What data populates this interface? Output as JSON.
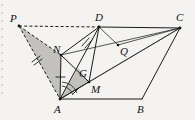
{
  "figure": {
    "background_color": "#f4f3f1",
    "line_color": "#1a1a1a",
    "shade_color": "#b9b7b4",
    "width": 195,
    "height": 120
  },
  "vertices": [
    {
      "id": "P",
      "label": "P",
      "x": 19,
      "y": 26,
      "label_x": 10,
      "label_y": 22
    },
    {
      "id": "D",
      "label": "D",
      "x": 99,
      "y": 27,
      "label_x": 95,
      "label_y": 21
    },
    {
      "id": "C",
      "label": "C",
      "x": 180,
      "y": 28,
      "label_x": 176,
      "label_y": 21
    },
    {
      "id": "N",
      "label": "N",
      "x": 61,
      "y": 55,
      "label_x": 54,
      "label_y": 52
    },
    {
      "id": "Q",
      "label": "Q",
      "x": 118,
      "y": 45,
      "label_x": 120,
      "label_y": 54
    },
    {
      "id": "G",
      "label": "G",
      "x": 78,
      "y": 68,
      "label_x": 80,
      "label_y": 75
    },
    {
      "id": "M",
      "label": "M",
      "x": 89,
      "y": 82,
      "label_x": 91,
      "label_y": 92
    },
    {
      "id": "A",
      "label": "A",
      "x": 60,
      "y": 99,
      "label_x": 55,
      "label_y": 112
    },
    {
      "id": "B",
      "label": "B",
      "x": 142,
      "y": 99,
      "label_x": 138,
      "label_y": 112
    }
  ],
  "edges": [
    {
      "name": "edge-P-D",
      "from": "P",
      "to": "D",
      "style": "dashed"
    },
    {
      "name": "edge-P-A",
      "from": "P",
      "to": "A",
      "style": "dashed"
    },
    {
      "name": "edge-P-N",
      "from": "P",
      "to": "N",
      "style": "dashed"
    },
    {
      "name": "edge-D-C",
      "from": "D",
      "to": "C",
      "style": "solid"
    },
    {
      "name": "edge-C-B",
      "from": "C",
      "to": "B",
      "style": "solid"
    },
    {
      "name": "edge-A-B",
      "from": "A",
      "to": "B",
      "style": "solid"
    },
    {
      "name": "edge-A-D",
      "from": "A",
      "to": "D",
      "style": "solid"
    },
    {
      "name": "edge-A-N",
      "from": "A",
      "to": "N",
      "style": "solid"
    },
    {
      "name": "edge-N-D",
      "from": "N",
      "to": "D",
      "style": "solid"
    },
    {
      "name": "edge-N-M",
      "from": "N",
      "to": "M",
      "style": "solid"
    },
    {
      "name": "edge-N-C",
      "from": "N",
      "to": "C",
      "style": "thin"
    },
    {
      "name": "edge-D-M",
      "from": "D",
      "to": "M",
      "style": "solid"
    },
    {
      "name": "edge-D-Q",
      "from": "D",
      "to": "Q",
      "style": "thin"
    },
    {
      "name": "edge-A-M",
      "from": "A",
      "to": "M",
      "style": "solid"
    },
    {
      "name": "edge-A-C",
      "from": "A",
      "to": "C",
      "style": "thin"
    },
    {
      "name": "edge-M-C",
      "from": "M",
      "to": "C",
      "style": "thin"
    },
    {
      "name": "edge-Q-C",
      "from": "Q",
      "to": "C",
      "style": "thin"
    }
  ],
  "shaded_regions": [
    {
      "name": "shade-triangle-PNA",
      "points": "P,N,A"
    },
    {
      "name": "shade-triangle-AGM",
      "points": "A,G,M"
    }
  ],
  "tick_marks": [
    {
      "name": "tick-segment-PN",
      "count": 2,
      "x": 36,
      "y": 61,
      "angle": 62
    },
    {
      "name": "tick-segment-AN",
      "count": 1,
      "x": 60,
      "y": 77,
      "angle": 2
    },
    {
      "name": "tick-segment-ND",
      "count": 2,
      "x": 86,
      "y": 42,
      "angle": 160
    },
    {
      "name": "tick-segment-AM",
      "count": 1,
      "x": 76,
      "y": 91,
      "angle": 118
    }
  ],
  "angle_marks": [
    {
      "name": "angle-mark-at-A",
      "vertex": "A",
      "radius": 13
    },
    {
      "name": "angle-mark-at-A-outer",
      "vertex": "A",
      "radius": 17
    }
  ]
}
